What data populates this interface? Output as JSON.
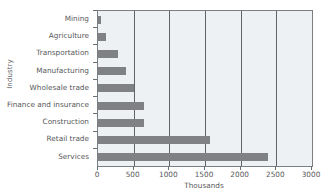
{
  "chart_data": {
    "type": "bar",
    "orientation": "horizontal",
    "title": "",
    "xlabel": "Thousands",
    "ylabel": "Industry",
    "categories": [
      "Mining",
      "Agriculture",
      "Transportation",
      "Manufacturing",
      "Wholesale trade",
      "Finance and insurance",
      "Construction",
      "Retail trade",
      "Services"
    ],
    "values": [
      40,
      110,
      280,
      390,
      500,
      640,
      640,
      1570,
      2390
    ],
    "xlim": [
      0,
      3000
    ],
    "xticks": [
      0,
      500,
      1000,
      1500,
      2000,
      2500,
      3000
    ],
    "xticklabels": [
      "0",
      "500",
      "1000",
      "1500",
      "2000",
      "2500",
      "3000"
    ],
    "grid": "vertical",
    "legend": "none",
    "series": [
      {
        "name": "Employment",
        "values": [
          40,
          110,
          280,
          390,
          500,
          640,
          640,
          1570,
          2390
        ]
      }
    ]
  },
  "style": {
    "bar_color": "#7f8184",
    "plot_background": "#edf1f3",
    "gridline_color": "#5f6467",
    "axis_color": "#7b7f82",
    "text_color": "#58595b",
    "page_background": "#ffffff"
  }
}
